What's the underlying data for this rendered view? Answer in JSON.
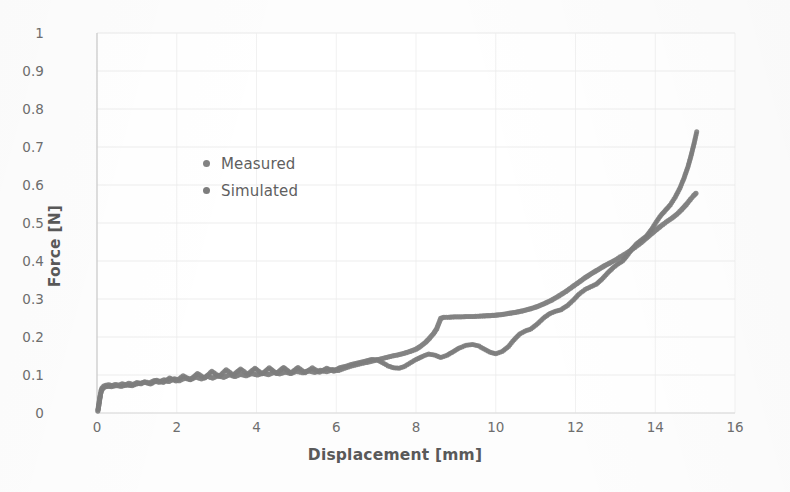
{
  "chart_data": {
    "type": "scatter",
    "title": "",
    "xlabel": "Displacement [mm]",
    "ylabel": "Force [N]",
    "xlim": [
      0,
      16
    ],
    "ylim": [
      0,
      1
    ],
    "xticks": [
      "0",
      "2",
      "4",
      "6",
      "8",
      "10",
      "12",
      "14",
      "16"
    ],
    "yticks": [
      "0",
      "0.1",
      "0.2",
      "0.3",
      "0.4",
      "0.5",
      "0.6",
      "0.7",
      "0.8",
      "0.9",
      "1"
    ],
    "grid": true,
    "legend_position": "inside-upper-left",
    "marker_color": "#808080",
    "series": [
      {
        "name": "Measured",
        "marker_color": "#828282",
        "marker_size": 5.2,
        "points": [
          [
            0.02,
            0.005
          ],
          [
            0.04,
            0.018
          ],
          [
            0.06,
            0.032
          ],
          [
            0.08,
            0.046
          ],
          [
            0.1,
            0.058
          ],
          [
            0.13,
            0.066
          ],
          [
            0.17,
            0.071
          ],
          [
            0.22,
            0.073
          ],
          [
            0.3,
            0.074
          ],
          [
            0.38,
            0.072
          ],
          [
            0.46,
            0.075
          ],
          [
            0.55,
            0.073
          ],
          [
            0.63,
            0.077
          ],
          [
            0.72,
            0.074
          ],
          [
            0.8,
            0.078
          ],
          [
            0.9,
            0.075
          ],
          [
            1.0,
            0.08
          ],
          [
            1.1,
            0.077
          ],
          [
            1.2,
            0.082
          ],
          [
            1.32,
            0.079
          ],
          [
            1.44,
            0.085
          ],
          [
            1.56,
            0.081
          ],
          [
            1.68,
            0.087
          ],
          [
            1.8,
            0.083
          ],
          [
            1.94,
            0.09
          ],
          [
            2.06,
            0.085
          ],
          [
            2.2,
            0.092
          ],
          [
            2.34,
            0.088
          ],
          [
            2.48,
            0.095
          ],
          [
            2.62,
            0.09
          ],
          [
            2.76,
            0.097
          ],
          [
            2.9,
            0.092
          ],
          [
            3.04,
            0.099
          ],
          [
            3.18,
            0.094
          ],
          [
            3.32,
            0.101
          ],
          [
            3.46,
            0.096
          ],
          [
            3.6,
            0.102
          ],
          [
            3.74,
            0.098
          ],
          [
            3.88,
            0.104
          ],
          [
            4.02,
            0.1
          ],
          [
            4.16,
            0.105
          ],
          [
            4.3,
            0.101
          ],
          [
            4.44,
            0.107
          ],
          [
            4.58,
            0.103
          ],
          [
            4.72,
            0.108
          ],
          [
            4.86,
            0.104
          ],
          [
            5.0,
            0.11
          ],
          [
            5.16,
            0.106
          ],
          [
            5.3,
            0.111
          ],
          [
            5.46,
            0.107
          ],
          [
            5.6,
            0.112
          ],
          [
            5.76,
            0.109
          ],
          [
            5.9,
            0.114
          ],
          [
            6.05,
            0.112
          ],
          [
            6.2,
            0.118
          ],
          [
            6.35,
            0.123
          ],
          [
            6.5,
            0.127
          ],
          [
            6.65,
            0.131
          ],
          [
            6.8,
            0.134
          ],
          [
            6.95,
            0.138
          ],
          [
            7.1,
            0.142
          ],
          [
            7.25,
            0.146
          ],
          [
            7.4,
            0.15
          ],
          [
            7.55,
            0.153
          ],
          [
            7.7,
            0.157
          ],
          [
            7.85,
            0.162
          ],
          [
            8.0,
            0.168
          ],
          [
            8.12,
            0.176
          ],
          [
            8.24,
            0.186
          ],
          [
            8.34,
            0.197
          ],
          [
            8.44,
            0.209
          ],
          [
            8.52,
            0.222
          ],
          [
            8.58,
            0.238
          ],
          [
            8.62,
            0.249
          ],
          [
            8.7,
            0.252
          ],
          [
            8.82,
            0.252
          ],
          [
            8.96,
            0.253
          ],
          [
            9.12,
            0.253
          ],
          [
            9.28,
            0.254
          ],
          [
            9.44,
            0.254
          ],
          [
            9.6,
            0.255
          ],
          [
            9.78,
            0.256
          ],
          [
            9.96,
            0.257
          ],
          [
            10.14,
            0.259
          ],
          [
            10.32,
            0.262
          ],
          [
            10.5,
            0.265
          ],
          [
            10.68,
            0.269
          ],
          [
            10.86,
            0.274
          ],
          [
            11.04,
            0.28
          ],
          [
            11.22,
            0.288
          ],
          [
            11.4,
            0.297
          ],
          [
            11.58,
            0.308
          ],
          [
            11.76,
            0.32
          ],
          [
            11.92,
            0.332
          ],
          [
            12.08,
            0.344
          ],
          [
            12.24,
            0.356
          ],
          [
            12.4,
            0.367
          ],
          [
            12.56,
            0.377
          ],
          [
            12.72,
            0.387
          ],
          [
            12.88,
            0.396
          ],
          [
            13.02,
            0.404
          ],
          [
            13.16,
            0.413
          ],
          [
            13.3,
            0.422
          ],
          [
            13.44,
            0.432
          ],
          [
            13.58,
            0.443
          ],
          [
            13.72,
            0.455
          ],
          [
            13.86,
            0.468
          ],
          [
            14.0,
            0.48
          ],
          [
            14.14,
            0.492
          ],
          [
            14.28,
            0.503
          ],
          [
            14.42,
            0.513
          ],
          [
            14.54,
            0.523
          ],
          [
            14.66,
            0.535
          ],
          [
            14.78,
            0.549
          ],
          [
            14.88,
            0.562
          ],
          [
            14.96,
            0.572
          ],
          [
            15.02,
            0.578
          ]
        ]
      },
      {
        "name": "Simulated",
        "marker_color": "#7d7d7d",
        "marker_size": 5.0,
        "points": [
          [
            0.03,
            0.01
          ],
          [
            0.06,
            0.03
          ],
          [
            0.09,
            0.05
          ],
          [
            0.13,
            0.062
          ],
          [
            0.18,
            0.068
          ],
          [
            0.26,
            0.07
          ],
          [
            0.36,
            0.069
          ],
          [
            0.48,
            0.072
          ],
          [
            0.6,
            0.07
          ],
          [
            0.74,
            0.074
          ],
          [
            0.88,
            0.072
          ],
          [
            1.02,
            0.077
          ],
          [
            1.18,
            0.081
          ],
          [
            1.34,
            0.076
          ],
          [
            1.5,
            0.086
          ],
          [
            1.66,
            0.08
          ],
          [
            1.82,
            0.092
          ],
          [
            1.98,
            0.084
          ],
          [
            2.16,
            0.098
          ],
          [
            2.34,
            0.088
          ],
          [
            2.52,
            0.104
          ],
          [
            2.7,
            0.092
          ],
          [
            2.88,
            0.11
          ],
          [
            3.06,
            0.096
          ],
          [
            3.24,
            0.114
          ],
          [
            3.42,
            0.1
          ],
          [
            3.6,
            0.116
          ],
          [
            3.78,
            0.102
          ],
          [
            3.96,
            0.118
          ],
          [
            4.14,
            0.103
          ],
          [
            4.32,
            0.119
          ],
          [
            4.5,
            0.104
          ],
          [
            4.68,
            0.12
          ],
          [
            4.86,
            0.105
          ],
          [
            5.04,
            0.12
          ],
          [
            5.22,
            0.106
          ],
          [
            5.4,
            0.119
          ],
          [
            5.58,
            0.107
          ],
          [
            5.76,
            0.118
          ],
          [
            5.94,
            0.11
          ],
          [
            6.1,
            0.12
          ],
          [
            6.26,
            0.124
          ],
          [
            6.42,
            0.129
          ],
          [
            6.58,
            0.133
          ],
          [
            6.74,
            0.137
          ],
          [
            6.88,
            0.141
          ],
          [
            7.02,
            0.14
          ],
          [
            7.16,
            0.132
          ],
          [
            7.3,
            0.124
          ],
          [
            7.44,
            0.119
          ],
          [
            7.58,
            0.118
          ],
          [
            7.72,
            0.123
          ],
          [
            7.86,
            0.132
          ],
          [
            8.0,
            0.141
          ],
          [
            8.16,
            0.149
          ],
          [
            8.32,
            0.155
          ],
          [
            8.48,
            0.152
          ],
          [
            8.62,
            0.146
          ],
          [
            8.78,
            0.152
          ],
          [
            8.94,
            0.162
          ],
          [
            9.1,
            0.172
          ],
          [
            9.26,
            0.178
          ],
          [
            9.42,
            0.18
          ],
          [
            9.58,
            0.176
          ],
          [
            9.72,
            0.168
          ],
          [
            9.86,
            0.16
          ],
          [
            10.0,
            0.156
          ],
          [
            10.16,
            0.162
          ],
          [
            10.32,
            0.175
          ],
          [
            10.46,
            0.193
          ],
          [
            10.6,
            0.208
          ],
          [
            10.74,
            0.216
          ],
          [
            10.88,
            0.221
          ],
          [
            11.04,
            0.234
          ],
          [
            11.2,
            0.25
          ],
          [
            11.36,
            0.262
          ],
          [
            11.5,
            0.268
          ],
          [
            11.64,
            0.272
          ],
          [
            11.8,
            0.283
          ],
          [
            11.96,
            0.299
          ],
          [
            12.1,
            0.314
          ],
          [
            12.24,
            0.325
          ],
          [
            12.38,
            0.332
          ],
          [
            12.52,
            0.339
          ],
          [
            12.66,
            0.352
          ],
          [
            12.8,
            0.368
          ],
          [
            12.94,
            0.382
          ],
          [
            13.06,
            0.392
          ],
          [
            13.18,
            0.4
          ],
          [
            13.3,
            0.415
          ],
          [
            13.42,
            0.432
          ],
          [
            13.54,
            0.446
          ],
          [
            13.66,
            0.456
          ],
          [
            13.78,
            0.466
          ],
          [
            13.9,
            0.482
          ],
          [
            14.02,
            0.502
          ],
          [
            14.14,
            0.52
          ],
          [
            14.26,
            0.534
          ],
          [
            14.38,
            0.548
          ],
          [
            14.5,
            0.568
          ],
          [
            14.62,
            0.592
          ],
          [
            14.72,
            0.618
          ],
          [
            14.82,
            0.648
          ],
          [
            14.9,
            0.678
          ],
          [
            14.98,
            0.712
          ],
          [
            15.04,
            0.74
          ]
        ]
      }
    ]
  },
  "axis": {
    "x_title": "Displacement [mm]",
    "y_title": "Force [N]"
  },
  "legend": {
    "items": [
      {
        "label": "Measured",
        "color": "#828282"
      },
      {
        "label": "Simulated",
        "color": "#7d7d7d"
      }
    ]
  }
}
